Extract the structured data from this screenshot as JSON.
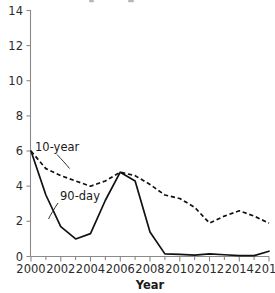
{
  "chart_data": {
    "type": "line",
    "title": "",
    "title_note": "title cropped off top edge of image; only faint glyph descenders visible",
    "xlabel": "Year",
    "ylabel": "",
    "x": [
      2000,
      2001,
      2002,
      2003,
      2004,
      2005,
      2006,
      2007,
      2008,
      2009,
      2010,
      2011,
      2012,
      2013,
      2014,
      2015,
      2016
    ],
    "xlim": [
      2000,
      2016
    ],
    "ylim": [
      0,
      14
    ],
    "xticks": [
      2000,
      2002,
      2004,
      2006,
      2008,
      2010,
      2012,
      2014,
      2016
    ],
    "xtick_labels": [
      "2000",
      "2002",
      "2004",
      "2006",
      "2008",
      "2010",
      "2012",
      "2014",
      "2016"
    ],
    "xminor_ticks": [
      2001,
      2003,
      2005,
      2007,
      2009,
      2011,
      2013,
      2015
    ],
    "yticks": [
      0,
      2,
      4,
      6,
      8,
      10,
      12,
      14
    ],
    "ytick_labels": [
      "0",
      "2",
      "4",
      "6",
      "8",
      "10",
      "12",
      "14"
    ],
    "grid": false,
    "legend_position": "inline-annotations",
    "series": [
      {
        "name": "10-year",
        "style": "dashed",
        "color": "#111111",
        "values": [
          6.0,
          5.0,
          4.6,
          4.3,
          4.0,
          4.3,
          4.8,
          4.6,
          4.1,
          3.5,
          3.3,
          2.8,
          1.9,
          2.3,
          2.6,
          2.3,
          1.9
        ]
      },
      {
        "name": "90-day",
        "style": "solid",
        "color": "#111111",
        "values": [
          6.0,
          3.5,
          1.7,
          1.0,
          1.3,
          3.2,
          4.8,
          4.3,
          1.4,
          0.15,
          0.12,
          0.08,
          0.15,
          0.1,
          0.05,
          0.05,
          0.3
        ]
      }
    ],
    "annotations": [
      {
        "text": "10-year",
        "series": "10-year",
        "x": 35,
        "y": 151
      },
      {
        "text": "90-day",
        "series": "90-day",
        "x": 60,
        "y": 200
      }
    ]
  }
}
